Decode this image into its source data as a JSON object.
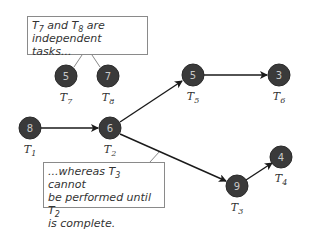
{
  "diagram": {
    "callouts": {
      "top": {
        "line1_pre": "T",
        "line1_sub1": "7",
        "line1_mid": " and T",
        "line1_sub2": "8",
        "line1_post": " are",
        "line2": "independent tasks..."
      },
      "bottom": {
        "line1_pre": "...whereas T",
        "line1_sub": "3",
        "line1_post": " cannot",
        "line2_pre": "be performed until T",
        "line2_sub": "2",
        "line3": "is complete."
      }
    },
    "nodes": [
      {
        "id": "T1",
        "value": "8",
        "label": "T",
        "sub": "1"
      },
      {
        "id": "T2",
        "value": "6",
        "label": "T",
        "sub": "2"
      },
      {
        "id": "T3",
        "value": "9",
        "label": "T",
        "sub": "3"
      },
      {
        "id": "T4",
        "value": "4",
        "label": "T",
        "sub": "4"
      },
      {
        "id": "T5",
        "value": "5",
        "label": "T",
        "sub": "5"
      },
      {
        "id": "T6",
        "value": "3",
        "label": "T",
        "sub": "6"
      },
      {
        "id": "T7",
        "value": "5",
        "label": "T",
        "sub": "7"
      },
      {
        "id": "T8",
        "value": "7",
        "label": "T",
        "sub": "8"
      }
    ],
    "edges": [
      {
        "from": "T1",
        "to": "T2"
      },
      {
        "from": "T2",
        "to": "T5"
      },
      {
        "from": "T5",
        "to": "T6"
      },
      {
        "from": "T2",
        "to": "T3"
      },
      {
        "from": "T3",
        "to": "T4"
      }
    ],
    "colors": {
      "node_fill": "#3a3a3a",
      "node_text": "#c8c8c8",
      "edge": "#1a1a1a",
      "callout_border": "#8a8a8a"
    }
  }
}
